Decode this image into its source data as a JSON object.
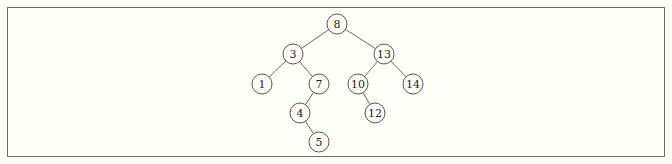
{
  "diagram": {
    "type": "binary-search-tree",
    "colors": {
      "background": "#fffef8",
      "border": "#6a6a6a",
      "edge": "#555555",
      "node_stroke": "#444444",
      "text": "#222222"
    },
    "node_radius": 10,
    "nodes": [
      {
        "id": "n8",
        "label": "8",
        "x": 337,
        "y": 24
      },
      {
        "id": "n3",
        "label": "3",
        "x": 293,
        "y": 54
      },
      {
        "id": "n13",
        "label": "13",
        "x": 384,
        "y": 54
      },
      {
        "id": "n1",
        "label": "1",
        "x": 262,
        "y": 84
      },
      {
        "id": "n7",
        "label": "7",
        "x": 319,
        "y": 84
      },
      {
        "id": "n10",
        "label": "10",
        "x": 358,
        "y": 84
      },
      {
        "id": "n14",
        "label": "14",
        "x": 413,
        "y": 84
      },
      {
        "id": "n4",
        "label": "4",
        "x": 300,
        "y": 113
      },
      {
        "id": "n12",
        "label": "12",
        "x": 375,
        "y": 113
      },
      {
        "id": "n5",
        "label": "5",
        "x": 319,
        "y": 142
      }
    ],
    "edges": [
      {
        "from": "n8",
        "to": "n3"
      },
      {
        "from": "n8",
        "to": "n13"
      },
      {
        "from": "n3",
        "to": "n1"
      },
      {
        "from": "n3",
        "to": "n7"
      },
      {
        "from": "n13",
        "to": "n10"
      },
      {
        "from": "n13",
        "to": "n14"
      },
      {
        "from": "n7",
        "to": "n4"
      },
      {
        "from": "n10",
        "to": "n12"
      },
      {
        "from": "n4",
        "to": "n5"
      }
    ]
  }
}
